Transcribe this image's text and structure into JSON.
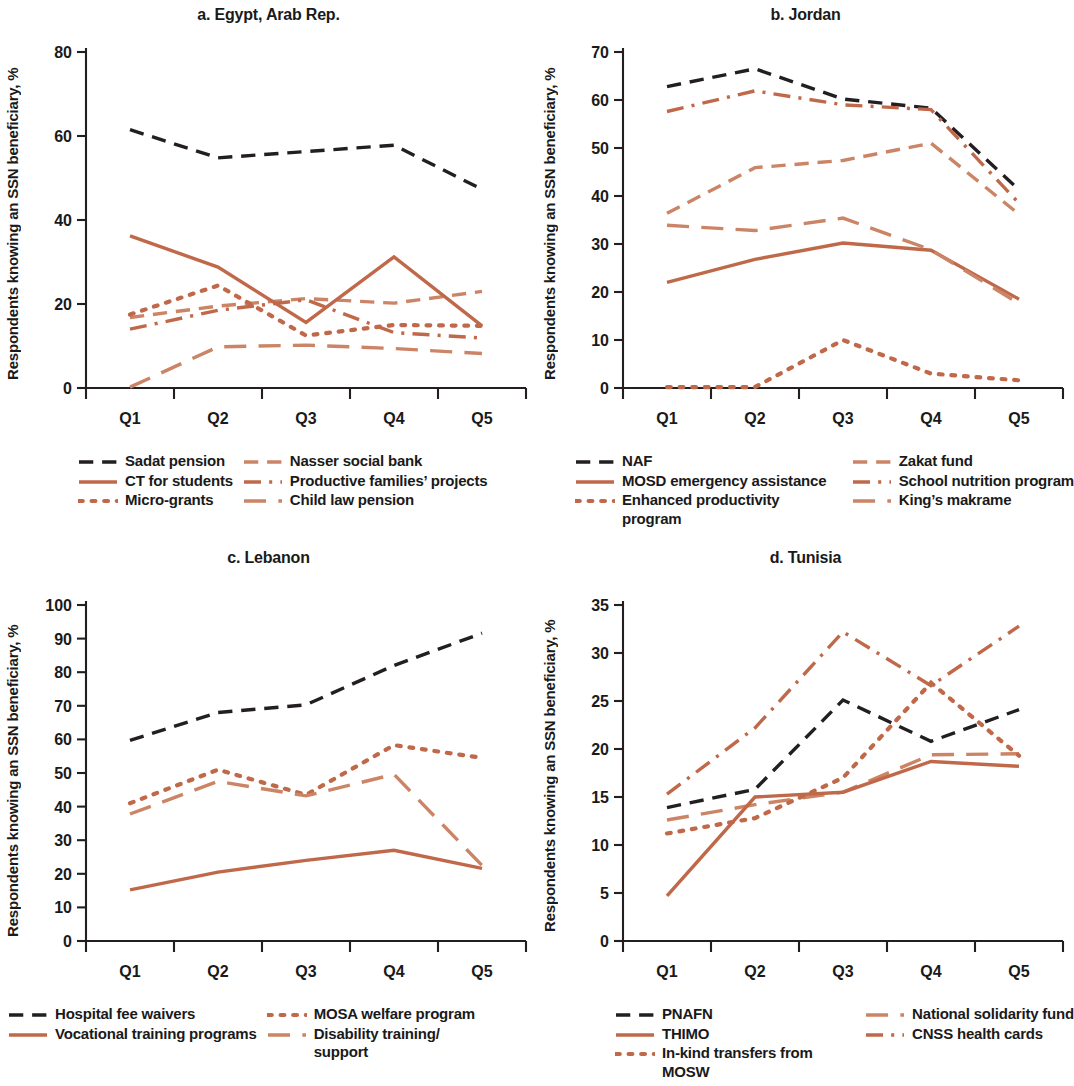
{
  "figure": {
    "ylabel": "Respondents knowing an SSN beneficiary, %",
    "colors": {
      "black": "#231f20",
      "orange": "#c0694a",
      "orange_light": "#cb8566"
    }
  },
  "panels": {
    "a": {
      "title": "a. Egypt, Arab Rep.",
      "ylabel": "Respondents knowing an SSN beneficiary, %",
      "yticks": [
        "0",
        "20",
        "40",
        "60",
        "80"
      ],
      "xticks": [
        "Q1",
        "Q2",
        "Q3",
        "Q4",
        "Q5"
      ],
      "legend": [
        {
          "label": "Sadat pension",
          "style": "dashed",
          "color": "#231f20"
        },
        {
          "label": "Nasser social bank",
          "style": "dashed",
          "color": "#cb8566"
        },
        {
          "label": "CT for students",
          "style": "solid",
          "color": "#c0694a"
        },
        {
          "label": "Productive families’ projects",
          "style": "dashdot",
          "color": "#c0694a"
        },
        {
          "label": "Micro-grants",
          "style": "dotted",
          "color": "#c0694a"
        },
        {
          "label": "Child law pension",
          "style": "dashed-long",
          "color": "#cb8566"
        }
      ]
    },
    "b": {
      "title": "b. Jordan",
      "ylabel": "Respondents knowing an SSN beneficiary, %",
      "yticks": [
        "0",
        "10",
        "20",
        "30",
        "40",
        "50",
        "60",
        "70"
      ],
      "xticks": [
        "Q1",
        "Q2",
        "Q3",
        "Q4",
        "Q5"
      ],
      "legend": [
        {
          "label": "NAF",
          "style": "dashed",
          "color": "#231f20"
        },
        {
          "label": "Zakat fund",
          "style": "dashed",
          "color": "#cb8566"
        },
        {
          "label": "MOSD emergency assistance",
          "style": "solid",
          "color": "#c0694a"
        },
        {
          "label": "School nutrition program",
          "style": "dashdot",
          "color": "#c0694a"
        },
        {
          "label": "Enhanced productivity program",
          "style": "dotted",
          "color": "#c0694a"
        },
        {
          "label": "King’s makrame",
          "style": "dashed-long",
          "color": "#cb8566"
        }
      ]
    },
    "c": {
      "title": "c. Lebanon",
      "ylabel": "Respondents knowing an SSN beneficiary, %",
      "yticks": [
        "0",
        "10",
        "20",
        "30",
        "40",
        "50",
        "60",
        "70",
        "80",
        "90",
        "100"
      ],
      "xticks": [
        "Q1",
        "Q2",
        "Q3",
        "Q4",
        "Q5"
      ],
      "legend": [
        {
          "label": "Hospital fee waivers",
          "style": "dashed",
          "color": "#231f20"
        },
        {
          "label": "MOSA welfare program",
          "style": "dotted",
          "color": "#c0694a"
        },
        {
          "label": "Vocational training programs",
          "style": "solid",
          "color": "#c0694a"
        },
        {
          "label": "Disability training/\nsupport",
          "style": "dashed-long",
          "color": "#cb8566"
        }
      ]
    },
    "d": {
      "title": "d. Tunisia",
      "ylabel": "Respondents knowing an SSN beneficiary, %",
      "yticks": [
        "0",
        "5",
        "10",
        "15",
        "20",
        "25",
        "30",
        "35"
      ],
      "xticks": [
        "Q1",
        "Q2",
        "Q3",
        "Q4",
        "Q5"
      ],
      "legend": [
        {
          "label": "PNAFN",
          "style": "dashed",
          "color": "#231f20"
        },
        {
          "label": "National solidarity fund",
          "style": "dashed-long",
          "color": "#cb8566"
        },
        {
          "label": "THIMO",
          "style": "solid",
          "color": "#c0694a"
        },
        {
          "label": "CNSS health cards",
          "style": "dashdot",
          "color": "#c0694a"
        },
        {
          "label": "In-kind transfers from MOSW",
          "style": "dotted",
          "color": "#c0694a"
        }
      ]
    }
  },
  "chart_data": [
    {
      "id": "a",
      "type": "line",
      "title": "a. Egypt, Arab Rep.",
      "xlabel": "",
      "ylabel": "Respondents knowing an SSN beneficiary, %",
      "categories": [
        "Q1",
        "Q2",
        "Q3",
        "Q4",
        "Q5"
      ],
      "ylim": [
        0,
        80
      ],
      "ytick_step": 20,
      "grid": false,
      "legend_position": "below",
      "series": [
        {
          "name": "Sadat pension",
          "style": "dashed",
          "color": "#231f20",
          "values": [
            61.5,
            54.8,
            56.3,
            57.8,
            47.3
          ]
        },
        {
          "name": "Nasser social bank",
          "style": "dashed",
          "color": "#cb8566",
          "values": [
            16.8,
            19.5,
            21.3,
            20.2,
            23.0
          ]
        },
        {
          "name": "CT for students",
          "style": "solid",
          "color": "#c0694a",
          "values": [
            36.2,
            28.8,
            15.6,
            31.2,
            14.8
          ]
        },
        {
          "name": "Productive families’ projects",
          "style": "dashdot",
          "color": "#c0694a",
          "values": [
            14.0,
            18.5,
            21.0,
            13.2,
            11.9
          ]
        },
        {
          "name": "Micro-grants",
          "style": "dotted",
          "color": "#c0694a",
          "values": [
            17.5,
            24.4,
            12.5,
            15.0,
            14.8
          ]
        },
        {
          "name": "Child law pension",
          "style": "dashed-long",
          "color": "#cb8566",
          "values": [
            0.2,
            9.8,
            10.2,
            9.4,
            8.2
          ]
        }
      ]
    },
    {
      "id": "b",
      "type": "line",
      "title": "b. Jordan",
      "xlabel": "",
      "ylabel": "Respondents knowing an SSN beneficiary, %",
      "categories": [
        "Q1",
        "Q2",
        "Q3",
        "Q4",
        "Q5"
      ],
      "ylim": [
        0,
        70
      ],
      "ytick_step": 10,
      "grid": false,
      "legend_position": "below",
      "series": [
        {
          "name": "NAF",
          "style": "dashed",
          "color": "#231f20",
          "values": [
            62.8,
            66.5,
            60.2,
            58.3,
            41.3
          ]
        },
        {
          "name": "Zakat fund",
          "style": "dashed",
          "color": "#cb8566",
          "values": [
            36.4,
            45.9,
            47.4,
            51.0,
            36.2
          ]
        },
        {
          "name": "MOSD emergency assistance",
          "style": "solid",
          "color": "#c0694a",
          "values": [
            22.0,
            26.8,
            30.2,
            28.7,
            18.5
          ]
        },
        {
          "name": "School nutrition program",
          "style": "dashdot",
          "color": "#c0694a",
          "values": [
            57.6,
            61.9,
            59.0,
            58.0,
            38.5
          ]
        },
        {
          "name": "Enhanced productivity program",
          "style": "dotted",
          "color": "#c0694a",
          "values": [
            0.2,
            0.2,
            10.0,
            3.0,
            1.6
          ]
        },
        {
          "name": "King’s makrame",
          "style": "dashed-long",
          "color": "#cb8566",
          "values": [
            33.9,
            32.8,
            35.4,
            28.8,
            17.6
          ]
        }
      ]
    },
    {
      "id": "c",
      "type": "line",
      "title": "c. Lebanon",
      "xlabel": "",
      "ylabel": "Respondents knowing an SSN beneficiary, %",
      "categories": [
        "Q1",
        "Q2",
        "Q3",
        "Q4",
        "Q5"
      ],
      "ylim": [
        0,
        100
      ],
      "ytick_step": 10,
      "grid": false,
      "legend_position": "below",
      "series": [
        {
          "name": "Hospital fee waivers",
          "style": "dashed",
          "color": "#231f20",
          "values": [
            59.7,
            68.0,
            70.3,
            82.0,
            91.6
          ]
        },
        {
          "name": "MOSA welfare program",
          "style": "dotted",
          "color": "#c0694a",
          "values": [
            41.0,
            51.0,
            43.5,
            58.3,
            54.5
          ]
        },
        {
          "name": "Vocational training programs",
          "style": "solid",
          "color": "#c0694a",
          "values": [
            15.2,
            20.5,
            24.0,
            27.0,
            21.6
          ]
        },
        {
          "name": "Disability training/support",
          "style": "dashed-long",
          "color": "#cb8566",
          "values": [
            37.8,
            47.5,
            43.2,
            49.6,
            22.5
          ]
        }
      ]
    },
    {
      "id": "d",
      "type": "line",
      "title": "d. Tunisia",
      "xlabel": "",
      "ylabel": "Respondents knowing an SSN beneficiary, %",
      "categories": [
        "Q1",
        "Q2",
        "Q3",
        "Q4",
        "Q5"
      ],
      "ylim": [
        0,
        35
      ],
      "ytick_step": 5,
      "grid": false,
      "legend_position": "below",
      "series": [
        {
          "name": "PNAFN",
          "style": "dashed",
          "color": "#231f20",
          "values": [
            13.9,
            15.8,
            25.1,
            20.8,
            24.1
          ]
        },
        {
          "name": "National solidarity fund",
          "style": "dashed-long",
          "color": "#cb8566",
          "values": [
            12.6,
            14.2,
            15.5,
            19.4,
            19.5
          ]
        },
        {
          "name": "THIMO",
          "style": "solid",
          "color": "#c0694a",
          "values": [
            4.7,
            15.0,
            15.5,
            18.7,
            18.2
          ]
        },
        {
          "name": "CNSS health cards",
          "style": "dashdot",
          "color": "#c0694a",
          "values": [
            15.3,
            22.2,
            32.2,
            26.6,
            32.8
          ]
        },
        {
          "name": "In-kind transfers from MOSW",
          "style": "dotted",
          "color": "#c0694a",
          "values": [
            11.2,
            12.8,
            17.0,
            26.9,
            19.3
          ]
        }
      ]
    }
  ]
}
